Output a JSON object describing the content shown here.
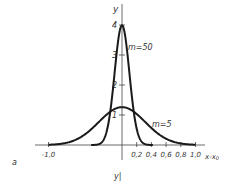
{
  "chart_data": {
    "type": "line",
    "title": "",
    "xlabel": "x-x0",
    "ylabel": "y",
    "panel_label": "a",
    "bottom_label": "y|",
    "xlim": [
      -1.2,
      1.1
    ],
    "ylim": [
      0,
      4.3
    ],
    "x_ticks": [
      "-1,0",
      "0,2",
      "0,4",
      "0,6",
      "0,8",
      "1,0"
    ],
    "x_tick_values": [
      -1.0,
      0.2,
      0.4,
      0.6,
      0.8,
      1.0
    ],
    "y_ticks": [
      "1",
      "2",
      "3",
      "4"
    ],
    "y_tick_values": [
      1,
      2,
      3,
      4
    ],
    "grid": false,
    "series": [
      {
        "name": "m=50",
        "formula": "sqrt(m/pi)*exp(-m*x^2)",
        "m": 50,
        "peak": 3.99,
        "x": [
          -0.4,
          -0.3,
          -0.2,
          -0.1,
          0,
          0.1,
          0.2,
          0.3,
          0.4
        ],
        "values": [
          0.0,
          0.04,
          0.54,
          2.42,
          3.99,
          2.42,
          0.54,
          0.04,
          0.0
        ]
      },
      {
        "name": "m=5",
        "formula": "sqrt(m/pi)*exp(-m*x^2)",
        "m": 5,
        "peak": 1.26,
        "x": [
          -1.0,
          -0.8,
          -0.6,
          -0.4,
          -0.2,
          0,
          0.2,
          0.4,
          0.6,
          0.8,
          1.0
        ],
        "values": [
          0.01,
          0.05,
          0.21,
          0.56,
          1.03,
          1.26,
          1.03,
          0.56,
          0.21,
          0.05,
          0.01
        ]
      }
    ]
  },
  "labels": {
    "y_axis": "y",
    "x_axis": "x-x",
    "x_axis_sub": "0",
    "series1": "m=50",
    "series2": "m=5",
    "panel": "a",
    "bottom": "y|"
  }
}
